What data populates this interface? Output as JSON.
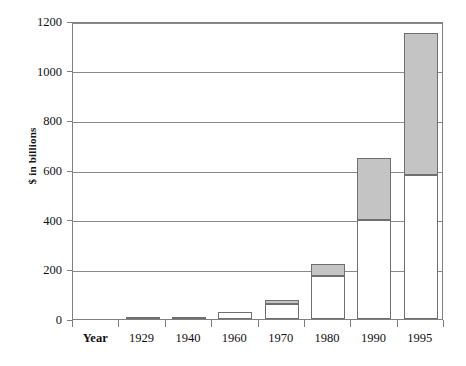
{
  "chart_data": {
    "type": "bar",
    "stacked": true,
    "title": "",
    "subtitle": "",
    "xlabel": "Year",
    "ylabel": "$ in billions",
    "categories": [
      "Year",
      "1929",
      "1940",
      "1960",
      "1970",
      "1980",
      "1990",
      "1995"
    ],
    "xtick_labels": [
      "Year",
      "1929",
      "1940",
      "1960",
      "1970",
      "1980",
      "1990",
      "1995"
    ],
    "ytick_labels": [
      "0",
      "200",
      "400",
      "600",
      "800",
      "1000",
      "1200"
    ],
    "ytick_values": [
      0,
      200,
      400,
      600,
      800,
      1000,
      1200
    ],
    "ylim": [
      0,
      1200
    ],
    "grid": true,
    "grid_axis": "y",
    "legend": null,
    "legend_position": "none",
    "series": [
      {
        "name": "lower-segment",
        "fill": "#ffffff",
        "values": [
          0,
          3,
          5,
          27,
          62,
          175,
          400,
          580
        ]
      },
      {
        "name": "upper-segment",
        "fill": "#c4c4c4",
        "values": [
          0,
          0,
          0,
          0,
          14,
          45,
          250,
          570
        ]
      }
    ],
    "totals": [
      0,
      3,
      5,
      27,
      76,
      220,
      650,
      1150
    ],
    "colors": {
      "lower_fill": "#ffffff",
      "upper_fill": "#c4c4c4",
      "bar_outline": "#6f6f6f",
      "axis": "#808080",
      "grid": "#8a8a8a",
      "text": "#111111",
      "background": "#ffffff"
    }
  }
}
